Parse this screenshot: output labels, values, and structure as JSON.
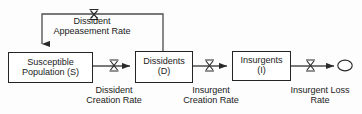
{
  "diagram": {
    "type": "stock-and-flow",
    "stocks": [
      {
        "id": "susceptible",
        "line1": "Susceptible",
        "line2": "Population (S)"
      },
      {
        "id": "dissidents",
        "line1": "Dissidents",
        "line2": "(D)"
      },
      {
        "id": "insurgents",
        "line1": "Insurgents",
        "line2": "(I)"
      }
    ],
    "flows": [
      {
        "id": "dissident-appeasement-rate",
        "line1": "Dissident",
        "line2": "Appeasement Rate",
        "icon": "valve-icon"
      },
      {
        "id": "dissident-creation-rate",
        "line1": "Dissident",
        "line2": "Creation Rate",
        "icon": "valve-icon"
      },
      {
        "id": "insurgent-creation-rate",
        "line1": "Insurgent",
        "line2": "Creation Rate",
        "icon": "valve-icon"
      },
      {
        "id": "insurgent-loss-rate",
        "line1": "Insurgent Loss",
        "line2": "Rate",
        "icon": "valve-icon"
      }
    ],
    "sink": {
      "id": "insurgent-loss-sink",
      "icon": "cloud-icon"
    },
    "colors": {
      "stroke": "#242424",
      "flow_line": "#4c4c4c",
      "text": "#1b1b1b",
      "background": "#fdfdfd"
    }
  }
}
